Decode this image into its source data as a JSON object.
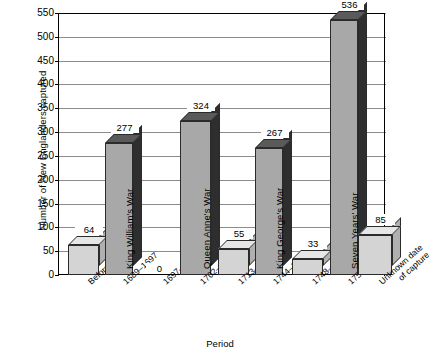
{
  "chart_data": {
    "type": "bar",
    "title": "",
    "xlabel": "Period",
    "ylabel": "Number of New Englanders captured",
    "ylim": [
      0,
      550
    ],
    "ytick_step": 50,
    "grid": true,
    "legend": "none",
    "style": "3d-column",
    "categories": [
      "Before 1689",
      "1689–1697",
      "1697–1702",
      "1702–1713",
      "1713–1744",
      "1744–1748",
      "1748–1754",
      "1754–1763",
      "Unknown date of capture"
    ],
    "values": [
      64,
      277,
      0,
      324,
      55,
      267,
      33,
      536,
      85
    ],
    "value_labels": [
      "64",
      "277",
      "0",
      "324",
      "55",
      "267",
      "33",
      "536",
      "85"
    ],
    "series_kind": [
      "period",
      "war",
      "period",
      "war",
      "period",
      "war",
      "period",
      "war",
      "period"
    ],
    "war_labels": [
      "King William's War",
      "Queen Anne's War",
      "King George's War",
      "Seven Years' War"
    ],
    "ytick_labels": [
      "0",
      "50",
      "100",
      "150",
      "200",
      "250",
      "300",
      "350",
      "400",
      "450",
      "500",
      "550"
    ]
  },
  "colors": {
    "light_bar_face": "#d4d4d4",
    "light_bar_side": "#b0b0b0",
    "light_bar_top": "#e6e6e6",
    "dark_bar_face": "#a8a8a8",
    "dark_bar_side": "#2e2e2e",
    "dark_bar_top": "#5a5a5a",
    "gridline": "#8c8c8c",
    "axis": "#000000",
    "background": "#ffffff"
  }
}
